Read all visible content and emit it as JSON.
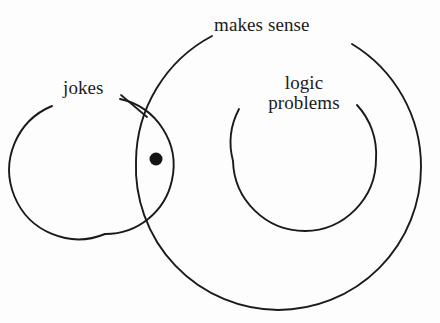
{
  "diagram": {
    "type": "venn",
    "title": "",
    "background_color": "#fdfdfd",
    "stroke_color": "#1a1a1a",
    "text_color": "#1b1b1b",
    "labels": {
      "makes_sense": "makes sense",
      "jokes": "jokes",
      "logic_line1": "logic",
      "logic_line2": "problems"
    },
    "sets": [
      {
        "name": "jokes",
        "label": "jokes",
        "cx": 105,
        "cy": 166,
        "r": 68,
        "arc_gap_deg": [
          196,
          232
        ]
      },
      {
        "name": "makes-sense",
        "label": "makes sense",
        "cx": 278,
        "cy": 167,
        "r": 143,
        "arc_gap_deg": [
          208,
          242
        ]
      },
      {
        "name": "logic-problems",
        "label": "logic problems",
        "cx": 305,
        "cy": 159,
        "r": 72,
        "arc_gap_deg": [
          215,
          315
        ]
      }
    ],
    "point": {
      "name": "intersection-dot",
      "cx": 156,
      "cy": 159,
      "r": 6.5,
      "region": "jokes ∩ makes sense"
    },
    "leader_line": {
      "name": "jokes-leader",
      "x1": 121,
      "y1": 95,
      "x2": 147,
      "y2": 117
    }
  }
}
